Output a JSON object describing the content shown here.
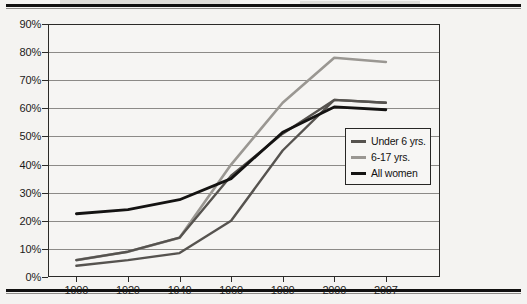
{
  "chart_data": {
    "type": "line",
    "title": "",
    "xlabel": "",
    "ylabel": "",
    "categories": [
      "1900",
      "1920",
      "1940",
      "1960",
      "1980",
      "2000",
      "2007"
    ],
    "x": [
      1900,
      1920,
      1940,
      1960,
      1980,
      2000,
      2007
    ],
    "ylim": [
      0,
      90
    ],
    "xlim_categorical": true,
    "grid": true,
    "legend_position": "middle-right",
    "ytick_labels": [
      "0%",
      "10%",
      "20%",
      "30%",
      "40%",
      "50%",
      "60%",
      "70%",
      "80%",
      "90%"
    ],
    "ytick_values": [
      0,
      10,
      20,
      30,
      40,
      50,
      60,
      70,
      80,
      90
    ],
    "xtick_labels": [
      "1900",
      "1920",
      "1940",
      "1960",
      "1980",
      "2000",
      "2007"
    ],
    "series": [
      {
        "name": "Under 6 yrs.",
        "color": "#56534f",
        "values": [
          6,
          9,
          14,
          36,
          51,
          63,
          62
        ]
      },
      {
        "name": "6-17 yrs.",
        "color": "#9a9792",
        "values": [
          6,
          9,
          14,
          40,
          62,
          78,
          76.5
        ]
      },
      {
        "name": "All women",
        "color": "#141312",
        "values": [
          22.5,
          24,
          27.5,
          35,
          51.5,
          60.5,
          59.5
        ]
      }
    ],
    "series_secondary": {
      "name": "Under 6 yrs. (lower branch)",
      "color": "#56534f",
      "values": [
        4,
        6,
        8.5,
        20,
        45,
        63,
        62
      ]
    }
  },
  "legend": {
    "items": [
      {
        "label": "Under 6 yrs.",
        "color": "#56534f"
      },
      {
        "label": "6-17 yrs.",
        "color": "#9a9792"
      },
      {
        "label": "All women",
        "color": "#141312"
      }
    ]
  },
  "colors": {
    "page_background": "#f4f3f1",
    "plot_background": "#f6f5f3",
    "gridline": "#8c8a87",
    "axis": "#2b2a28",
    "rule": "#111010"
  }
}
